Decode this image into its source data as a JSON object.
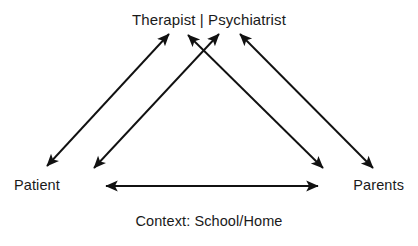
{
  "diagram": {
    "title": "Therapist | Psychiatrist",
    "nodes": {
      "top": "Therapist | Psychiatrist",
      "bottom_left": "Patient",
      "bottom_right": "Parents"
    },
    "caption": "Context: School/Home",
    "colors": {
      "stroke": "#111111",
      "text": "#1a1a1a",
      "background": "#ffffff"
    },
    "edges": [
      {
        "id": "patient-therapist-outer",
        "from": "Patient",
        "to": "Therapist | Psychiatrist",
        "direction": "bidirectional",
        "x1": 47,
        "y1": 166,
        "x2": 169,
        "y2": 34
      },
      {
        "id": "patient-therapist-inner",
        "from": "Patient",
        "to": "Therapist | Psychiatrist",
        "direction": "bidirectional",
        "x1": 94,
        "y1": 168,
        "x2": 219,
        "y2": 34
      },
      {
        "id": "parents-therapist-inner",
        "from": "Parents",
        "to": "Therapist | Psychiatrist",
        "direction": "bidirectional",
        "x1": 323,
        "y1": 168,
        "x2": 188,
        "y2": 35
      },
      {
        "id": "parents-therapist-outer",
        "from": "Parents",
        "to": "Therapist | Psychiatrist",
        "direction": "bidirectional",
        "x1": 373,
        "y1": 168,
        "x2": 240,
        "y2": 34
      },
      {
        "id": "patient-parents",
        "from": "Patient",
        "to": "Parents",
        "direction": "bidirectional",
        "x1": 106,
        "y1": 186,
        "x2": 318,
        "y2": 186
      }
    ]
  }
}
